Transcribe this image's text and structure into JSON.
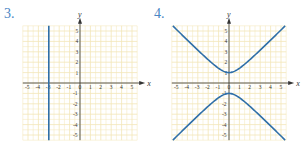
{
  "chart_data": [
    {
      "type": "line",
      "label": "3.",
      "title": "",
      "xlabel": "x",
      "ylabel": "y",
      "xlim": [
        -5.5,
        5.5
      ],
      "ylim": [
        -5.5,
        5.5
      ],
      "grid": true,
      "xticks": [
        -5,
        -4,
        -3,
        -2,
        -1,
        0,
        1,
        2,
        3,
        4,
        5
      ],
      "yticks": [
        -5,
        -4,
        -3,
        -2,
        -1,
        1,
        2,
        3,
        4,
        5
      ],
      "series": [
        {
          "name": "vertical line x = -3",
          "equation": "x = -3",
          "points": [
            [
              -3,
              -5.5
            ],
            [
              -3,
              5.5
            ]
          ]
        }
      ]
    },
    {
      "type": "line",
      "label": "4.",
      "title": "",
      "xlabel": "x",
      "ylabel": "y",
      "xlim": [
        -5.5,
        5.5
      ],
      "ylim": [
        -5.5,
        5.5
      ],
      "grid": true,
      "xticks": [
        -5,
        -4,
        -3,
        -2,
        -1,
        0,
        1,
        2,
        3,
        4,
        5
      ],
      "yticks": [
        -5,
        -4,
        -3,
        -2,
        -1,
        1,
        2,
        3,
        4,
        5
      ],
      "series": [
        {
          "name": "upper branch",
          "equation": "y = sqrt(1 + x^2)",
          "branch": 1
        },
        {
          "name": "lower branch",
          "equation": "y = -sqrt(1 + x^2)",
          "branch": -1
        }
      ]
    }
  ],
  "colors": {
    "curve": "#2f6fa8",
    "grid": "#f3e6b8",
    "axis": "#333333",
    "label": "#4a86c5"
  }
}
